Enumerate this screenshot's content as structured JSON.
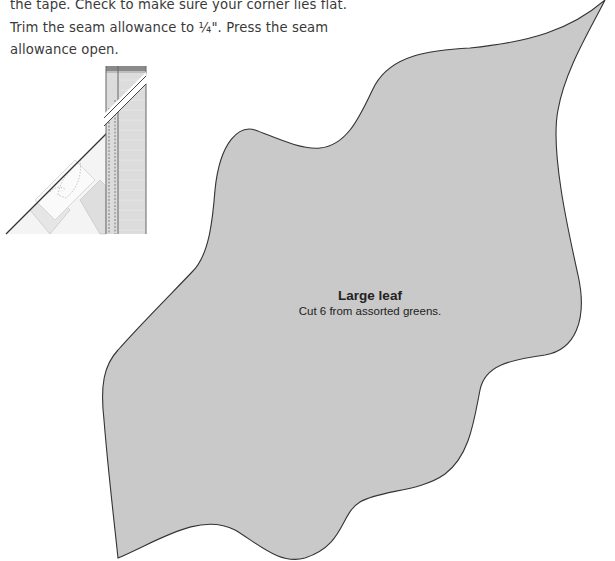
{
  "instructions": {
    "lines": [
      "the tape. Check to make sure your corner lies flat.",
      "Trim the seam allowance to ¼\". Press the seam",
      "allowance open."
    ]
  },
  "diagram": {
    "colors": {
      "strip_fill": "#dcdcdc",
      "strip_top": "#8a8a8a",
      "block_fill": "#efefef",
      "outline": "#555555"
    }
  },
  "leaf_template": {
    "title": "Large leaf",
    "subtitle": "Cut 6 from assorted greens.",
    "fill_color": "#c9c9c9",
    "outline_color": "#333333"
  }
}
